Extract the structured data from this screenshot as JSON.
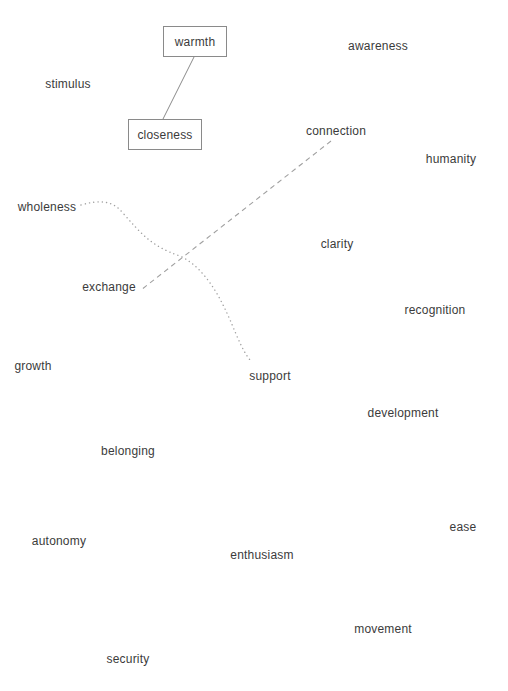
{
  "diagram": {
    "type": "word-map",
    "boxed_nodes": [
      {
        "id": "warmth",
        "label": "warmth",
        "x": 163,
        "y": 26,
        "w": 64,
        "h": 31
      },
      {
        "id": "closeness",
        "label": "closeness",
        "x": 128,
        "y": 119,
        "w": 74,
        "h": 31
      }
    ],
    "nodes": [
      {
        "id": "awareness",
        "label": "awareness",
        "cx": 378,
        "cy": 46
      },
      {
        "id": "stimulus",
        "label": "stimulus",
        "cx": 68,
        "cy": 84
      },
      {
        "id": "connection",
        "label": "connection",
        "cx": 336,
        "cy": 131
      },
      {
        "id": "humanity",
        "label": "humanity",
        "cx": 451,
        "cy": 159
      },
      {
        "id": "wholeness",
        "label": "wholeness",
        "cx": 47,
        "cy": 207
      },
      {
        "id": "clarity",
        "label": "clarity",
        "cx": 337,
        "cy": 244
      },
      {
        "id": "exchange",
        "label": "exchange",
        "cx": 109,
        "cy": 287
      },
      {
        "id": "recognition",
        "label": "recognition",
        "cx": 435,
        "cy": 310
      },
      {
        "id": "growth",
        "label": "growth",
        "cx": 33,
        "cy": 366
      },
      {
        "id": "support",
        "label": "support",
        "cx": 270,
        "cy": 376
      },
      {
        "id": "development",
        "label": "development",
        "cx": 403,
        "cy": 413
      },
      {
        "id": "belonging",
        "label": "belonging",
        "cx": 128,
        "cy": 451
      },
      {
        "id": "ease",
        "label": "ease",
        "cx": 463,
        "cy": 527
      },
      {
        "id": "autonomy",
        "label": "autonomy",
        "cx": 59,
        "cy": 541
      },
      {
        "id": "enthusiasm",
        "label": "enthusiasm",
        "cx": 262,
        "cy": 555
      },
      {
        "id": "movement",
        "label": "movement",
        "cx": 383,
        "cy": 629
      },
      {
        "id": "security",
        "label": "security",
        "cx": 128,
        "cy": 659
      }
    ],
    "edges": [
      {
        "from": "warmth",
        "to": "closeness",
        "style": "solid",
        "path": "M 194 57 L 163 119",
        "color": "#8a8a8a"
      },
      {
        "from": "connection",
        "to": "exchange",
        "style": "dashed",
        "path": "M 331 141 L 141 290",
        "color": "#a0a0a0"
      },
      {
        "from": "wholeness",
        "to": "support",
        "style": "dotted",
        "path": "M 81 205 C 98 200, 112 200, 122 212 C 140 232, 150 246, 180 256 C 210 270, 226 310, 236 334 C 242 348, 246 355, 250 360",
        "color": "#a0a0a0"
      }
    ]
  }
}
